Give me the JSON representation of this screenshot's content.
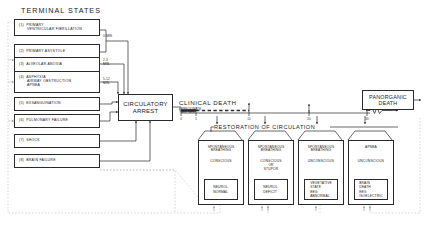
{
  "headings": {
    "terminal_states": "TERMINAL STATES",
    "restoration": "RESTORATION OF CIRCULATION"
  },
  "terminal_states": [
    {
      "num": "(1)",
      "lines": [
        "PRIMARY",
        "VENTRICULAR FIBRILLATION"
      ]
    },
    {
      "num": "(2)",
      "lines": [
        "PRIMARY ASYSTOLE"
      ]
    },
    {
      "num": "(3)",
      "lines": [
        "ALVEOLAR ANOXIA"
      ]
    },
    {
      "num": "(4)",
      "lines": [
        "ASPHYXIA",
        "AIRWAY OBSTRUCTION",
        "APNEA"
      ]
    },
    {
      "num": "(5)",
      "lines": [
        "EXSANGUINATION"
      ]
    },
    {
      "num": "(6)",
      "lines": [
        "PULMONARY FAILURE"
      ]
    },
    {
      "num": "(7)",
      "lines": [
        "SHOCK"
      ]
    },
    {
      "num": "(8)",
      "lines": [
        "BRAIN FAILURE"
      ]
    }
  ],
  "onset_labels": [
    {
      "text": "0 MIN."
    },
    {
      "text": "2-3\nMIN."
    },
    {
      "text": "5-12\nMIN."
    }
  ],
  "central": {
    "circulatory_arrest": "CIRCULATORY\nARREST",
    "clinical_death": "CLINICAL DEATH",
    "approximate_time": "APPROXIMATE\nTIME, MIN.",
    "panorganic_death": "PANORGANIC\nDEATH"
  },
  "timeline": {
    "ticks": [
      "0",
      "5",
      "10",
      "20",
      "30"
    ]
  },
  "outcomes": [
    {
      "breathing": "SPONTANEOUS\nBREATHING",
      "consciousness": "CONSCIOUS",
      "result": "NEUROL.\nNORMAL"
    },
    {
      "breathing": "SPONTANEOUS\nBREATHING",
      "consciousness": "CONSCIOUS\nOR\nSTUPOR",
      "result": "NEUROL.\nDEFICIT"
    },
    {
      "breathing": "SPONTANEOUS\nBREATHING",
      "consciousness": "UNCONSCIOUS",
      "result": "VEGETATIVE\nSTATE\nEEG\nABNORMAL"
    },
    {
      "breathing": "APNEA",
      "consciousness": "UNCONSCIOUS",
      "result": "BRAIN\nDEATH\nEEG\nISOELECTRIC"
    }
  ],
  "colors": {
    "stroke": "#2a2a2a",
    "faint": "#bdbdbd",
    "background": "#ffffff"
  }
}
